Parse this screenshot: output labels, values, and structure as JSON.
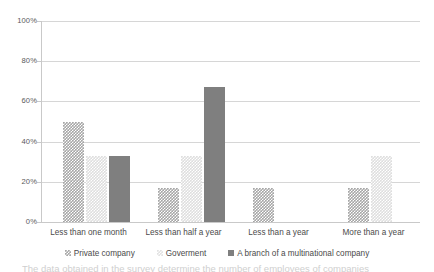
{
  "chart_data": {
    "type": "bar",
    "title": "",
    "xlabel": "",
    "ylabel": "",
    "ylim": [
      0,
      100
    ],
    "y_ticks": [
      "0%",
      "20%",
      "40%",
      "60%",
      "80%",
      "100%"
    ],
    "y_tick_values": [
      0,
      20,
      40,
      60,
      80,
      100
    ],
    "grid": true,
    "legend_position": "bottom",
    "categories": [
      "Less than one month",
      "Less than half a year",
      "Less than a year",
      "More than a year"
    ],
    "series": [
      {
        "name": "Private company",
        "values": [
          50,
          17,
          17,
          17
        ]
      },
      {
        "name": "Goverment",
        "values": [
          33,
          33,
          0,
          33
        ]
      },
      {
        "name": "A branch of a multinational company",
        "values": [
          33,
          67,
          0,
          0
        ]
      }
    ]
  },
  "legend": {
    "items": [
      {
        "label": "Private company",
        "marker": "checkered-dark-square-icon"
      },
      {
        "label": "Goverment",
        "marker": "checkered-light-square-icon"
      },
      {
        "label": "A branch of a multinational company",
        "marker": "solid-gray-square-icon"
      }
    ]
  },
  "colors": {
    "private": "#a6a6a6",
    "government": "#dedede",
    "multinational": "#7f7f7f",
    "gridline": "#d6d6d6",
    "axis": "#c9c9c9",
    "text": "#4a4a4a"
  },
  "caption": {
    "cut_off_text": "The data obtained in the survey determine the number of employees of companies"
  }
}
